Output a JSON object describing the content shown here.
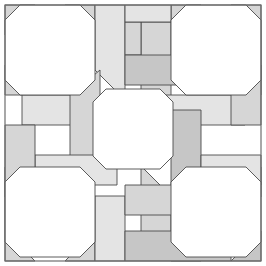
{
  "figure": {
    "type": "geometric-tessellation-diagram",
    "canvas": {
      "width": 266,
      "height": 266,
      "background": "#ffffff"
    }
  },
  "palette": {
    "background": "#ffffff",
    "octagon_fill": "#ffffff",
    "tile_light": "#e4e4e4",
    "tile_mid": "#d6d6d6",
    "tile_dark": "#c6c6c6",
    "stroke": "#4a4a4a",
    "frame_stroke": "#6e6e6e",
    "stroke_width": "0.9"
  },
  "frame": {
    "label": "outer frame",
    "x": 5,
    "y": 5,
    "width": 256,
    "height": 256
  },
  "octagons": [
    {
      "name": "octagon-top-left",
      "cx": 50,
      "cy": 50,
      "r": 45,
      "cut": 15,
      "fill": "#ffffff"
    },
    {
      "name": "octagon-top-right",
      "cx": 216,
      "cy": 50,
      "r": 45,
      "cut": 15,
      "fill": "#ffffff"
    },
    {
      "name": "octagon-center",
      "cx": 133,
      "cy": 129,
      "r": 40,
      "cut": 13,
      "fill": "#ffffff"
    },
    {
      "name": "octagon-bottom-left",
      "cx": 50,
      "cy": 212,
      "r": 45,
      "cut": 15,
      "fill": "#ffffff"
    },
    {
      "name": "octagon-bottom-right",
      "cx": 216,
      "cy": 212,
      "r": 45,
      "cut": 15,
      "fill": "#ffffff"
    }
  ],
  "tiles": [
    {
      "name": "tile-corner-tl",
      "shade": "#d6d6d6",
      "points": "5,5 35,5 5,35"
    },
    {
      "name": "tile-corner-tr",
      "shade": "#d6d6d6",
      "points": "231,5 261,5 261,35"
    },
    {
      "name": "tile-corner-bl",
      "shade": "#d6d6d6",
      "points": "5,231 35,261 5,261"
    },
    {
      "name": "tile-corner-br",
      "shade": "#c6c6c6",
      "points": "261,231 261,261 231,261"
    },
    {
      "name": "tile-tl-edge-right-upper",
      "shade": "#d6d6d6",
      "points": "95,5 95,35 65,5"
    },
    {
      "name": "tile-tl-edge-bottom",
      "shade": "#d6d6d6",
      "points": "5,65 35,95 5,95"
    },
    {
      "name": "tile-tr-edge-left-upper",
      "shade": "#d6d6d6",
      "points": "171,5 201,5 171,35"
    },
    {
      "name": "tile-tr-edge-bottom",
      "shade": "#d6d6d6",
      "points": "261,65 261,95 231,95"
    },
    {
      "name": "tile-bl-edge-top",
      "shade": "#d6d6d6",
      "points": "5,167 35,167 5,197"
    },
    {
      "name": "tile-bl-edge-right-lower",
      "shade": "#d6d6d6",
      "points": "65,261 95,231 95,261"
    },
    {
      "name": "tile-br-edge-top",
      "shade": "#d6d6d6",
      "points": "261,167 261,197 231,167"
    },
    {
      "name": "tile-br-edge-left-lower",
      "shade": "#d6d6d6",
      "points": "171,261 201,261 171,231"
    },
    {
      "name": "plank-top-center-left-vertical",
      "shade": "#e4e4e4",
      "points": "95,5 125,5 125,100 95,70"
    },
    {
      "name": "plank-top-center-right-vertical",
      "shade": "#d6d6d6",
      "points": "141,22 171,22 171,100 141,100"
    },
    {
      "name": "plank-top-center-horizontal",
      "shade": "#d6d6d6",
      "points": "125,22 141,22 141,55 125,55"
    },
    {
      "name": "plank-top-bar",
      "shade": "#c6c6c6",
      "points": "125,55 231,55 231,85 125,85"
    },
    {
      "name": "plank-top-left-bar",
      "shade": "#e4e4e4",
      "points": "125,5 171,5 171,22 125,22"
    },
    {
      "name": "plank-left-center-horizontal-upper",
      "shade": "#e4e4e4",
      "points": "22,95 117,95 117,125 22,125"
    },
    {
      "name": "plank-left-center-vertical",
      "shade": "#d6d6d6",
      "points": "70,95 100,70 100,160 70,160"
    },
    {
      "name": "plank-left-lower-horizontal",
      "shade": "#e4e4e4",
      "points": "35,155 117,155 117,185 35,185"
    },
    {
      "name": "plank-left-block",
      "shade": "#d6d6d6",
      "points": "5,125 35,125 35,231 5,231"
    },
    {
      "name": "plank-right-center-horizontal-upper",
      "shade": "#e4e4e4",
      "points": "166,95 245,95 245,125 166,125"
    },
    {
      "name": "plank-right-center-vertical",
      "shade": "#c6c6c6",
      "points": "171,110 201,110 201,200 171,200"
    },
    {
      "name": "plank-right-lower-horizontal",
      "shade": "#e4e4e4",
      "points": "201,155 261,155 261,185 201,185"
    },
    {
      "name": "plank-right-block",
      "shade": "#d6d6d6",
      "points": "231,35 261,35 261,125 231,125"
    },
    {
      "name": "plank-bottom-center-left-vertical",
      "shade": "#e4e4e4",
      "points": "95,196 125,196 125,261 95,261"
    },
    {
      "name": "plank-bottom-center-right-vertical",
      "shade": "#d6d6d6",
      "points": "141,166 171,196 171,244 141,244"
    },
    {
      "name": "plank-bottom-bar",
      "shade": "#c6c6c6",
      "points": "125,231 231,231 231,261 125,261"
    },
    {
      "name": "plank-bottom-center-horizontal",
      "shade": "#d6d6d6",
      "points": "125,185 231,185 231,215 125,215"
    }
  ],
  "geometry_notes": {
    "octagon_count": 5,
    "corner_octagons": 4,
    "center_octagons": 1,
    "symmetry": "4-fold rotational (pinwheel) about center"
  }
}
